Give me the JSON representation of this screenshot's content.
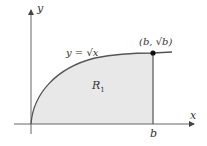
{
  "diagram": {
    "axes": {
      "x_label": "x",
      "y_label": "y"
    },
    "curve_label": "y = √x",
    "point_label": "(b, √b)",
    "region_label": "R",
    "region_subscript": "1",
    "tick_label": "b",
    "colors": {
      "region_fill": "#e8e8e8",
      "curve": "#555555",
      "axes": "#666666",
      "point": "#111111"
    }
  }
}
